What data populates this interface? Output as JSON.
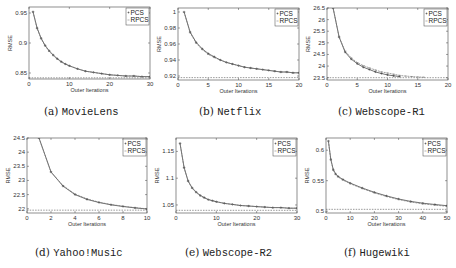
{
  "figure": {
    "panels": [
      {
        "id": "a",
        "letter": "(a)",
        "name": "MovieLens"
      },
      {
        "id": "b",
        "letter": "(b)",
        "name": "Netflix"
      },
      {
        "id": "c",
        "letter": "(c)",
        "name": "Webscope-R1"
      },
      {
        "id": "d",
        "letter": "(d)",
        "name": "Yahoo!Music"
      },
      {
        "id": "e",
        "letter": "(e)",
        "name": "Webscope-R2"
      },
      {
        "id": "f",
        "letter": "(f)",
        "name": "Hugewiki"
      }
    ]
  },
  "chart_data": [
    {
      "type": "line",
      "title": "(a) MovieLens",
      "xlabel": "Outer Iterations",
      "ylabel": "RMSE",
      "xlim": [
        0,
        30
      ],
      "ylim": [
        0.84,
        0.96
      ],
      "xticks": [
        0,
        10,
        20,
        30
      ],
      "yticks": [
        0.85,
        0.9,
        0.95
      ],
      "ytick_labels": [
        "0.85",
        "0.9",
        "0.95"
      ],
      "legend": [
        "PCS",
        "RPCS"
      ],
      "legend_position": "upper right",
      "grid": false,
      "baseline": 0.842,
      "series": [
        {
          "name": "PCS",
          "x": [
            1,
            2,
            3,
            4,
            5,
            6,
            7,
            8,
            9,
            10,
            12,
            14,
            16,
            18,
            20,
            22,
            24,
            26,
            28,
            30
          ],
          "values": [
            0.952,
            0.925,
            0.908,
            0.896,
            0.887,
            0.88,
            0.874,
            0.869,
            0.865,
            0.862,
            0.857,
            0.853,
            0.851,
            0.849,
            0.847,
            0.846,
            0.845,
            0.845,
            0.844,
            0.844
          ]
        },
        {
          "name": "RPCS",
          "x": [
            1,
            2,
            3,
            4,
            5,
            6,
            7,
            8,
            9,
            10,
            12,
            14,
            16,
            18,
            20,
            22,
            24,
            26,
            28,
            30
          ],
          "values": [
            0.952,
            0.924,
            0.907,
            0.895,
            0.886,
            0.879,
            0.873,
            0.868,
            0.865,
            0.862,
            0.857,
            0.853,
            0.851,
            0.849,
            0.847,
            0.846,
            0.845,
            0.845,
            0.844,
            0.844
          ]
        }
      ]
    },
    {
      "type": "line",
      "title": "(b) Netflix",
      "xlabel": "Outer Iterations",
      "ylabel": "RMSE",
      "xlim": [
        0,
        20
      ],
      "ylim": [
        0.915,
        1.005
      ],
      "xticks": [
        0,
        5,
        10,
        15,
        20
      ],
      "yticks": [
        0.92,
        0.94,
        0.96,
        0.98,
        1.0
      ],
      "ytick_labels": [
        "0.92",
        "0.94",
        "0.96",
        "0.98",
        "1"
      ],
      "legend": [
        "PCS",
        "RPCS"
      ],
      "legend_position": "upper right",
      "grid": false,
      "baseline": 0.918,
      "series": [
        {
          "name": "PCS",
          "x": [
            1,
            2,
            3,
            4,
            5,
            6,
            7,
            8,
            9,
            10,
            11,
            12,
            13,
            14,
            15,
            16,
            17,
            18,
            19,
            20
          ],
          "values": [
            1.0,
            0.975,
            0.962,
            0.954,
            0.948,
            0.944,
            0.94,
            0.937,
            0.935,
            0.933,
            0.931,
            0.93,
            0.929,
            0.928,
            0.927,
            0.926,
            0.925,
            0.925,
            0.924,
            0.924
          ]
        },
        {
          "name": "RPCS",
          "x": [
            1,
            2,
            3,
            4,
            5,
            6,
            7,
            8,
            9,
            10,
            11,
            12,
            13,
            14,
            15,
            16,
            17,
            18,
            19,
            20
          ],
          "values": [
            1.0,
            0.974,
            0.961,
            0.953,
            0.947,
            0.943,
            0.94,
            0.937,
            0.935,
            0.933,
            0.931,
            0.93,
            0.929,
            0.928,
            0.927,
            0.926,
            0.925,
            0.925,
            0.924,
            0.924
          ]
        }
      ]
    },
    {
      "type": "line",
      "title": "(c) Webscope-R1",
      "xlabel": "Outer Iterations",
      "ylabel": "RMSE",
      "xlim": [
        0,
        20
      ],
      "ylim": [
        23.4,
        26.5
      ],
      "xticks": [
        0,
        5,
        10,
        15,
        20
      ],
      "yticks": [
        23.5,
        24,
        24.5,
        25,
        25.5,
        26,
        26.5
      ],
      "ytick_labels": [
        "23.5",
        "24",
        "24.5",
        "25",
        "25.5",
        "26",
        "26.5"
      ],
      "legend": [
        "PCS",
        "RPCS"
      ],
      "legend_position": "upper right",
      "grid": false,
      "baseline": 23.5,
      "series": [
        {
          "name": "PCS",
          "x": [
            1,
            2,
            3,
            4,
            5,
            6,
            7,
            8,
            9,
            10,
            11,
            12
          ],
          "values": [
            26.5,
            25.25,
            24.6,
            24.3,
            24.1,
            23.95,
            23.85,
            23.75,
            23.68,
            23.62,
            23.58,
            23.55
          ]
        },
        {
          "name": "RPCS",
          "x": [
            1,
            2,
            3,
            4,
            5,
            6,
            7,
            8,
            9,
            10,
            11,
            12,
            13,
            14,
            15,
            16
          ],
          "values": [
            26.5,
            25.25,
            24.65,
            24.35,
            24.15,
            24.02,
            23.92,
            23.83,
            23.75,
            23.7,
            23.65,
            23.6,
            23.57,
            23.55,
            23.53,
            23.52
          ]
        }
      ]
    },
    {
      "type": "line",
      "title": "(d) Yahoo!Music",
      "xlabel": "Outer Iterations",
      "ylabel": "RMSE",
      "xlim": [
        0,
        10
      ],
      "ylim": [
        21.85,
        24.5
      ],
      "xticks": [
        0,
        2,
        4,
        6,
        8,
        10
      ],
      "yticks": [
        22,
        22.5,
        23,
        23.5,
        24,
        24.5
      ],
      "ytick_labels": [
        "22",
        "22.5",
        "23",
        "23.5",
        "24",
        "24.5"
      ],
      "legend": [
        "PCS",
        "RPCS"
      ],
      "legend_position": "upper right",
      "grid": false,
      "baseline": 21.95,
      "series": [
        {
          "name": "PCS",
          "x": [
            1,
            2,
            3,
            4,
            5,
            6,
            7,
            8,
            9,
            10
          ],
          "values": [
            24.5,
            23.3,
            22.8,
            22.5,
            22.33,
            22.22,
            22.14,
            22.08,
            22.03,
            21.99
          ]
        },
        {
          "name": "RPCS",
          "x": [
            1,
            2,
            3,
            4,
            5,
            6,
            7,
            8,
            9,
            10
          ],
          "values": [
            24.5,
            23.3,
            22.82,
            22.52,
            22.35,
            22.23,
            22.15,
            22.09,
            22.04,
            22.0
          ]
        }
      ]
    },
    {
      "type": "line",
      "title": "(e) Webscope-R2",
      "xlabel": "Outer Iterations",
      "ylabel": "RMSE",
      "xlim": [
        0,
        30
      ],
      "ylim": [
        1.035,
        1.175
      ],
      "xticks": [
        0,
        10,
        20,
        30
      ],
      "yticks": [
        1.05,
        1.1,
        1.15
      ],
      "ytick_labels": [
        "1.05",
        "1.1",
        "1.15"
      ],
      "legend": [
        "PCS",
        "RPCS"
      ],
      "legend_position": "upper right",
      "grid": false,
      "baseline": 1.04,
      "series": [
        {
          "name": "PCS",
          "x": [
            1,
            2,
            3,
            4,
            5,
            6,
            7,
            8,
            9,
            10,
            12,
            14,
            16,
            18,
            20,
            22,
            24,
            26,
            28,
            30
          ],
          "values": [
            1.165,
            1.12,
            1.095,
            1.082,
            1.074,
            1.068,
            1.064,
            1.06,
            1.058,
            1.056,
            1.053,
            1.051,
            1.049,
            1.048,
            1.047,
            1.046,
            1.045,
            1.045,
            1.044,
            1.044
          ]
        },
        {
          "name": "RPCS",
          "x": [
            1,
            2,
            3,
            4,
            5,
            6,
            7,
            8,
            9,
            10,
            12,
            14,
            16,
            18,
            20,
            22,
            24,
            26,
            28,
            30
          ],
          "values": [
            1.165,
            1.119,
            1.094,
            1.081,
            1.073,
            1.067,
            1.063,
            1.06,
            1.058,
            1.056,
            1.053,
            1.051,
            1.049,
            1.048,
            1.047,
            1.046,
            1.045,
            1.045,
            1.044,
            1.044
          ]
        }
      ]
    },
    {
      "type": "line",
      "title": "(f) Hugewiki",
      "xlabel": "Outer Iterations",
      "ylabel": "RMSE",
      "xlim": [
        0,
        50
      ],
      "ylim": [
        0.497,
        0.62
      ],
      "xticks": [
        0,
        10,
        20,
        30,
        40,
        50
      ],
      "yticks": [
        0.5,
        0.55,
        0.6
      ],
      "ytick_labels": [
        "0.5",
        "0.55",
        "0.6"
      ],
      "legend": [
        "PCS",
        "RPCS"
      ],
      "legend_position": "upper right",
      "grid": false,
      "baseline": 0.503,
      "series": [
        {
          "name": "PCS",
          "x": [
            1,
            2,
            3,
            4,
            5,
            7,
            10,
            15,
            20,
            25,
            30,
            35,
            40,
            45,
            50
          ],
          "values": [
            0.615,
            0.585,
            0.568,
            0.561,
            0.557,
            0.552,
            0.546,
            0.538,
            0.531,
            0.525,
            0.52,
            0.516,
            0.513,
            0.511,
            0.509
          ]
        },
        {
          "name": "RPCS",
          "x": [
            1,
            2,
            3,
            4,
            5,
            7,
            10,
            15,
            20,
            25,
            30,
            35,
            40,
            45,
            50
          ],
          "values": [
            0.615,
            0.584,
            0.567,
            0.56,
            0.556,
            0.551,
            0.545,
            0.537,
            0.53,
            0.524,
            0.519,
            0.515,
            0.512,
            0.51,
            0.508
          ]
        }
      ]
    }
  ]
}
